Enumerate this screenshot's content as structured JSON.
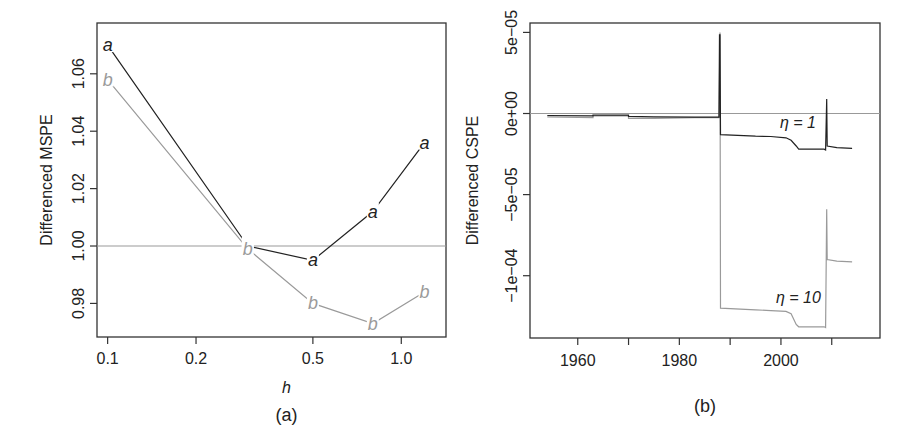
{
  "chart_data": [
    {
      "panel": "(a)",
      "type": "line",
      "title": "",
      "xlabel": "h",
      "ylabel": "Differenced MSPE",
      "xscale": "log",
      "xlim": [
        0.092,
        1.42
      ],
      "ylim": [
        0.9683,
        1.0777
      ],
      "xticks": [
        0.1,
        0.2,
        0.5,
        1.0
      ],
      "xtick_labels": [
        "0.1",
        "0.2",
        "0.5",
        "1.0"
      ],
      "yticks": [
        0.98,
        1.0,
        1.02,
        1.04,
        1.06
      ],
      "ytick_labels": [
        "0.98",
        "1.00",
        "1.02",
        "1.04",
        "1.06"
      ],
      "reference_line": 1.0,
      "grid": false,
      "legend": "none (points labelled with plotting symbols 'a' and 'b')",
      "x": [
        0.1,
        0.3,
        0.5,
        0.8,
        1.2
      ],
      "series": [
        {
          "name": "a",
          "color": "#222222",
          "values": [
            1.07,
            1.0,
            0.995,
            1.012,
            1.036
          ]
        },
        {
          "name": "b",
          "color": "#9a9a9a",
          "values": [
            1.058,
            0.999,
            0.98,
            0.973,
            0.984
          ]
        }
      ]
    },
    {
      "panel": "(b)",
      "type": "line",
      "title": "",
      "xlabel": "",
      "ylabel": "Differenced CSPE",
      "xlim": [
        1950.6,
        2019.5
      ],
      "ylim": [
        -0.0001384,
        5.58e-05
      ],
      "xticks": [
        1960,
        1970,
        1980,
        1990,
        2000,
        2010
      ],
      "xtick_labels": [
        "1960",
        "",
        "1980",
        "",
        "2000",
        ""
      ],
      "yticks": [
        -0.0001,
        -5e-05,
        0,
        5e-05
      ],
      "ytick_labels": [
        "−1e−04",
        "−5e−05",
        "0e+00",
        "5e−05"
      ],
      "reference_line": 0,
      "grid": false,
      "annotations": [
        "η = 1",
        "η = 10"
      ],
      "series": [
        {
          "name": "η = 1",
          "color": "#222222",
          "x": [
            1954,
            1963,
            1963,
            1970,
            1970,
            1975,
            1983,
            1987.8,
            1987.9,
            1988,
            1988.1,
            1995,
            1998,
            2001,
            2002,
            2003,
            2003.5,
            2008.5,
            2008.8,
            2009,
            2009.1,
            2011,
            2014
          ],
          "values": [
            -1.2e-06,
            -1.5e-06,
            -1e-06,
            -1e-06,
            -1.8e-06,
            -2e-06,
            -2.2e-06,
            -2.2e-06,
            4.85e-05,
            4.85e-05,
            -1.3e-05,
            -1.4e-05,
            -1.42e-05,
            -1.5e-05,
            -1.65e-05,
            -2e-05,
            -2.2e-05,
            -2.2e-05,
            -2.25e-05,
            9e-06,
            -2e-05,
            -2.1e-05,
            -2.15e-05
          ]
        },
        {
          "name": "η = 10",
          "color": "#9a9a9a",
          "x": [
            1954,
            1963,
            1963,
            1970,
            1970,
            1975,
            1983,
            1987.8,
            1988,
            1988.1,
            1995,
            1998,
            2001,
            2002,
            2003,
            2003.5,
            2008.5,
            2008.8,
            2009,
            2009.1,
            2011,
            2014
          ],
          "values": [
            -2e-06,
            -2.5e-06,
            -1.5e-06,
            -1.5e-06,
            -3e-06,
            -3e-06,
            -2.5e-06,
            -2.5e-06,
            5e-05,
            -0.00012,
            -0.000121,
            -0.0001215,
            -0.000122,
            -0.0001235,
            -0.00013,
            -0.0001315,
            -0.0001315,
            -0.000132,
            -5.9e-05,
            -9e-05,
            -9.1e-05,
            -9.15e-05
          ]
        }
      ]
    }
  ],
  "figure": {
    "panel_a": {
      "caption": "(a)",
      "xlabel": "h",
      "ylabel": "Differenced MSPE"
    },
    "panel_b": {
      "caption": "(b)",
      "ylabel": "Differenced CSPE",
      "label_eta1": "η = 1",
      "label_eta10": "η = 10"
    }
  }
}
